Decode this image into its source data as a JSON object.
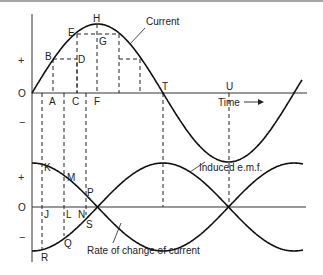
{
  "diagram": {
    "upper_graph": {
      "axis_labels": {
        "plus": "+",
        "origin": "O",
        "minus": "−",
        "time": "Time"
      },
      "curve_label": "Current",
      "point_labels": {
        "A": "A",
        "B": "B",
        "C": "C",
        "D": "D",
        "E": "E",
        "F": "F",
        "G": "G",
        "H": "H",
        "T": "T",
        "U": "U"
      }
    },
    "lower_graph": {
      "axis_labels": {
        "plus": "+",
        "origin": "O",
        "minus": "−"
      },
      "curve_labels": {
        "emf": "Induced e.m.f.",
        "rate": "Rate of change of current"
      },
      "point_labels": {
        "K": "K",
        "J": "J",
        "M": "M",
        "L": "L",
        "N": "N",
        "P": "P",
        "S": "S",
        "Q": "Q",
        "R": "R"
      }
    }
  }
}
